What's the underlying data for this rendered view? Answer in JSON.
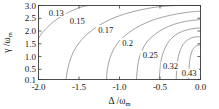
{
  "figure": {
    "background_color": "#ffffff",
    "line_color": "#8c8c8c",
    "axis_color": "#3a3a3a",
    "text_color": "#151515"
  },
  "chart_data": {
    "type": "line",
    "title": "",
    "subtitle": "",
    "xlabel": "Δ /ω",
    "xlabel_sub": "m",
    "ylabel": "γ /ω",
    "ylabel_sub": "m",
    "xlim": [
      -2.0,
      0.0
    ],
    "ylim": [
      0.1,
      3.0
    ],
    "xticks": [
      -2.0,
      -1.5,
      -1.0,
      -0.5,
      0.0
    ],
    "xticklabels": [
      "-2.0",
      "-1.5",
      "-1.0",
      "-0.5",
      "0.0"
    ],
    "yticks": [
      0.1,
      0.5,
      1.0,
      1.5,
      2.0,
      2.5,
      3.0
    ],
    "yticklabels": [
      "0.1",
      "0.5",
      "1.0",
      "1.5",
      "2.0",
      "2.5",
      "3.0"
    ],
    "grid": false,
    "legend_position": "none",
    "plot_kind": "contour",
    "contour_levels": [
      0.13,
      0.15,
      0.17,
      0.2,
      0.25,
      0.32,
      0.43
    ],
    "contour_labels": [
      "0.13",
      "0.15",
      "0.17",
      "0.2",
      "0.25",
      "0.32",
      "0.43"
    ],
    "series": [
      {
        "name": "0.13",
        "label": "0.13",
        "label_xy": [
          -1.78,
          2.72
        ],
        "points": [
          [
            -2.0,
            1.72
          ],
          [
            -1.95,
            1.95
          ],
          [
            -1.9,
            2.12
          ],
          [
            -1.85,
            2.27
          ],
          [
            -1.8,
            2.4
          ],
          [
            -1.72,
            2.57
          ],
          [
            -1.65,
            2.7
          ],
          [
            -1.55,
            2.85
          ],
          [
            -1.45,
            2.96
          ],
          [
            -1.38,
            3.0
          ]
        ]
      },
      {
        "name": "0.15",
        "label": "0.15",
        "label_xy": [
          -1.52,
          2.4
        ],
        "points": [
          [
            -1.66,
            0.1
          ],
          [
            -1.64,
            0.5
          ],
          [
            -1.6,
            0.95
          ],
          [
            -1.54,
            1.35
          ],
          [
            -1.45,
            1.72
          ],
          [
            -1.33,
            2.05
          ],
          [
            -1.18,
            2.35
          ],
          [
            -1.0,
            2.6
          ],
          [
            -0.78,
            2.8
          ],
          [
            -0.52,
            2.95
          ],
          [
            -0.28,
            3.0
          ],
          [
            0.0,
            3.0
          ]
        ]
      },
      {
        "name": "0.17",
        "label": "0.17",
        "label_xy": [
          -1.17,
          2.05
        ],
        "points": [
          [
            -1.16,
            0.1
          ],
          [
            -1.15,
            0.5
          ],
          [
            -1.12,
            0.92
          ],
          [
            -1.07,
            1.3
          ],
          [
            -0.99,
            1.65
          ],
          [
            -0.88,
            1.95
          ],
          [
            -0.74,
            2.22
          ],
          [
            -0.57,
            2.45
          ],
          [
            -0.37,
            2.62
          ],
          [
            -0.17,
            2.73
          ],
          [
            0.0,
            2.78
          ]
        ]
      },
      {
        "name": "0.2",
        "label": "0.2",
        "label_xy": [
          -0.9,
          1.55
        ],
        "points": [
          [
            -0.79,
            0.1
          ],
          [
            -0.78,
            0.5
          ],
          [
            -0.76,
            0.9
          ],
          [
            -0.72,
            1.25
          ],
          [
            -0.66,
            1.58
          ],
          [
            -0.57,
            1.85
          ],
          [
            -0.46,
            2.08
          ],
          [
            -0.33,
            2.26
          ],
          [
            -0.18,
            2.38
          ],
          [
            0.0,
            2.45
          ]
        ]
      },
      {
        "name": "0.25",
        "label": "0.25",
        "label_xy": [
          -0.62,
          1.05
        ],
        "points": [
          [
            -0.51,
            0.1
          ],
          [
            -0.5,
            0.5
          ],
          [
            -0.485,
            0.88
          ],
          [
            -0.455,
            1.2
          ],
          [
            -0.41,
            1.5
          ],
          [
            -0.35,
            1.74
          ],
          [
            -0.27,
            1.92
          ],
          [
            -0.17,
            2.04
          ],
          [
            -0.08,
            2.1
          ],
          [
            0.0,
            2.12
          ]
        ]
      },
      {
        "name": "0.32",
        "label": "0.32",
        "label_xy": [
          -0.37,
          0.62
        ],
        "points": [
          [
            -0.3,
            0.1
          ],
          [
            -0.295,
            0.45
          ],
          [
            -0.285,
            0.8
          ],
          [
            -0.265,
            1.1
          ],
          [
            -0.235,
            1.36
          ],
          [
            -0.195,
            1.55
          ],
          [
            -0.145,
            1.68
          ],
          [
            -0.08,
            1.76
          ],
          [
            0.0,
            1.78
          ]
        ]
      },
      {
        "name": "0.43",
        "label": "0.43",
        "label_xy": [
          -0.14,
          0.34
        ],
        "points": [
          [
            -0.145,
            0.1
          ],
          [
            -0.143,
            0.4
          ],
          [
            -0.138,
            0.7
          ],
          [
            -0.128,
            0.95
          ],
          [
            -0.112,
            1.15
          ],
          [
            -0.09,
            1.3
          ],
          [
            -0.06,
            1.4
          ],
          [
            -0.03,
            1.45
          ],
          [
            0.0,
            1.46
          ]
        ]
      }
    ]
  }
}
